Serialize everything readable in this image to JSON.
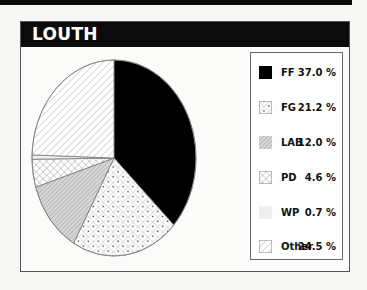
{
  "title": "LOUTH",
  "legend": [
    {
      "label": "FF",
      "value": "37.0 %",
      "pattern": "solid-black"
    },
    {
      "label": "FG",
      "value": "21.2 %",
      "pattern": "crosshatch-dots"
    },
    {
      "label": "LAB",
      "value": "12.0 %",
      "pattern": "dense-gray-hatch"
    },
    {
      "label": "PD",
      "value": "4.6 %",
      "pattern": "crosshatch"
    },
    {
      "label": "WP",
      "value": "0.7 %",
      "pattern": "light-gray"
    },
    {
      "label": "Other",
      "value": "24.5 %",
      "pattern": "diagonal-lines"
    }
  ],
  "chart_data": {
    "type": "pie",
    "title": "LOUTH",
    "categories": [
      "FF",
      "FG",
      "LAB",
      "PD",
      "WP",
      "Other"
    ],
    "values": [
      37.0,
      21.2,
      12.0,
      4.6,
      0.7,
      24.5
    ],
    "unit": "%",
    "legend_position": "right",
    "start_angle": "12 o'clock, clockwise"
  }
}
